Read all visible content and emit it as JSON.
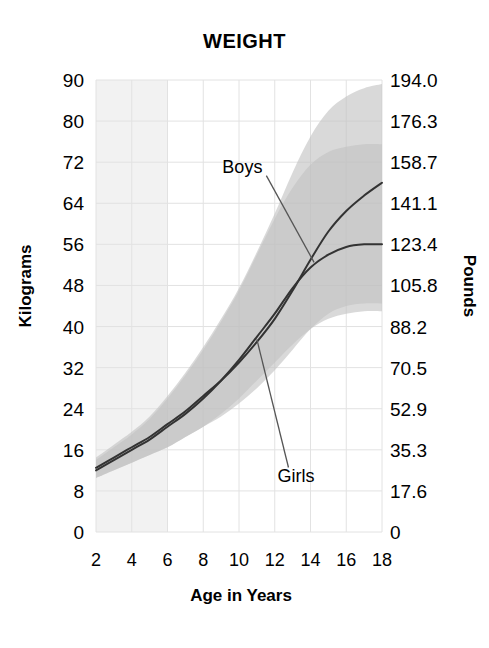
{
  "chart_data": {
    "type": "line",
    "title": "WEIGHT",
    "xlabel": "Age in Years",
    "ylabel": "Kilograms",
    "ylabel_secondary": "Pounds",
    "xlim": [
      2,
      18
    ],
    "ylim": [
      0,
      90
    ],
    "grid": true,
    "legend_position": "inline-annotations",
    "xticks": [
      "2",
      "4",
      "6",
      "8",
      "10",
      "12",
      "14",
      "16",
      "18"
    ],
    "xtick_values": [
      2,
      4,
      6,
      8,
      10,
      12,
      14,
      16,
      18
    ],
    "yticks_left": [
      "90",
      "80",
      "72",
      "64",
      "56",
      "48",
      "40",
      "32",
      "24",
      "16",
      "8",
      "0"
    ],
    "ytick_values_left": [
      90,
      80,
      72,
      64,
      56,
      48,
      40,
      32,
      24,
      16,
      8,
      0
    ],
    "yticks_right": [
      "194.0",
      "176.3",
      "158.7",
      "141.1",
      "123.4",
      "105.8",
      "88.2",
      "70.5",
      "52.9",
      "35.3",
      "17.6",
      "0"
    ],
    "ytick_values_right": [
      194.0,
      176.3,
      158.7,
      141.1,
      123.4,
      105.8,
      88.2,
      70.5,
      52.9,
      35.3,
      17.6,
      0
    ],
    "annotations": [
      {
        "text": "Boys",
        "x": 10.3,
        "y": 72.5,
        "points_to_x": 14.2,
        "points_to_y": 52.5
      },
      {
        "text": "Girls",
        "x": 12.6,
        "y": 11.0,
        "points_to_x": 11.0,
        "points_to_y": 37.5
      }
    ],
    "x": [
      2,
      3,
      4,
      5,
      6,
      7,
      8,
      9,
      10,
      11,
      12,
      13,
      14,
      15,
      16,
      17,
      18
    ],
    "series": [
      {
        "name": "Boys",
        "values": [
          12.5,
          14.5,
          16.5,
          18.5,
          21.0,
          23.5,
          26.5,
          29.5,
          33.0,
          37.0,
          41.5,
          47.0,
          53.0,
          58.5,
          62.5,
          65.5,
          68.0
        ],
        "color": "#333333",
        "band_upper": [
          14.5,
          17.0,
          19.5,
          22.5,
          26.5,
          31.0,
          36.0,
          41.5,
          47.5,
          54.5,
          62.0,
          70.0,
          77.0,
          82.5,
          86.0,
          88.0,
          89.0
        ],
        "band_lower": [
          10.5,
          12.0,
          13.5,
          15.0,
          16.5,
          18.5,
          20.5,
          22.5,
          25.0,
          28.0,
          31.5,
          35.5,
          39.5,
          42.5,
          44.0,
          44.5,
          44.5
        ]
      },
      {
        "name": "Girls",
        "values": [
          12.0,
          14.0,
          16.0,
          18.0,
          20.5,
          23.0,
          26.0,
          29.5,
          33.5,
          38.0,
          42.5,
          47.5,
          51.5,
          54.0,
          55.5,
          56.0,
          56.0
        ],
        "color": "#333333",
        "band_upper": [
          14.0,
          16.5,
          19.0,
          22.0,
          26.0,
          30.5,
          35.5,
          41.0,
          47.0,
          54.0,
          61.0,
          67.0,
          71.5,
          74.0,
          75.0,
          75.5,
          75.5
        ],
        "band_lower": [
          10.5,
          12.0,
          13.5,
          15.0,
          16.5,
          18.5,
          20.5,
          23.0,
          26.0,
          29.5,
          33.0,
          36.5,
          39.5,
          41.5,
          42.5,
          43.0,
          43.0
        ]
      }
    ],
    "highlight_band": {
      "x_start": 2,
      "x_end": 6,
      "color": "#f2f2f2"
    },
    "colors": {
      "band_fill": "#c2c2c2",
      "line": "#333333",
      "grid": "#e2e2e2",
      "leader_line": "#555555",
      "background": "#ffffff",
      "text": "#000000"
    }
  }
}
